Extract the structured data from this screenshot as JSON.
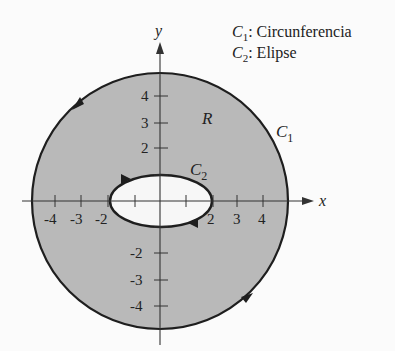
{
  "legend": [
    {
      "symbol": "C",
      "sub": "1",
      "text": ": Circunferencia"
    },
    {
      "symbol": "C",
      "sub": "2",
      "text": ": Elipse"
    }
  ],
  "axes": {
    "x_label": "x",
    "y_label": "y",
    "x_ticks": [
      "-4",
      "-3",
      "-2",
      "2",
      "3",
      "4"
    ],
    "y_ticks": [
      "4",
      "3",
      "2",
      "-2",
      "-3",
      "-4"
    ]
  },
  "labels": {
    "region": "R",
    "c1": {
      "symbol": "C",
      "sub": "1"
    },
    "c2": {
      "symbol": "C",
      "sub": "2"
    }
  },
  "colors": {
    "region_fill": "#b9b9b9",
    "ellipse_fill": "#f7f7f7",
    "stroke": "#1e1e1e"
  },
  "shapes": {
    "circle": {
      "radius_units": 5,
      "orientation": "counterclockwise"
    },
    "ellipse": {
      "semi_major_units": 2,
      "semi_minor_units": 1,
      "orientation": "clockwise"
    }
  }
}
